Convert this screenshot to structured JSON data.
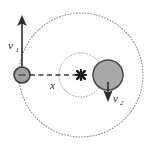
{
  "figure": {
    "name": "two-body-orbit-diagram",
    "background_color": "#ffffff",
    "stroke_color": "#2b2b2b",
    "body_fill_color": "#a8a8a8",
    "dotted_color": "#8c8c8c",
    "dashed_color": "#3a3a3a",
    "labels": {
      "v1": "v",
      "v1_sub": "1",
      "v2": "v",
      "v2_sub": "2",
      "x": "x"
    },
    "elements": {
      "outer_orbit": {
        "name": "outer-dotted-circle",
        "cx": 81,
        "cy": 75,
        "r": 62,
        "style": "dotted"
      },
      "inner_orbit": {
        "name": "inner-dotted-circle",
        "cx": 81,
        "cy": 75,
        "r": 22,
        "style": "dotted"
      },
      "small_body": {
        "name": "small-mass-circle",
        "cx": 22,
        "cy": 75,
        "r": 8
      },
      "large_body": {
        "name": "large-mass-circle",
        "cx": 108,
        "cy": 75,
        "r": 15
      },
      "center_of_mass": {
        "name": "center-of-mass-marker",
        "cx": 81,
        "cy": 75,
        "glyph": "cross-marker"
      },
      "v1_arrow": {
        "name": "velocity-vector-v1",
        "x": 22,
        "y_tail": 75,
        "y_tip": 16,
        "direction": "up"
      },
      "v2_arrow": {
        "name": "velocity-vector-v2",
        "x": 108,
        "y_tail": 84,
        "y_tip": 101,
        "direction": "down"
      },
      "separation_line": {
        "name": "separation-distance-dashed-line",
        "x1": 30,
        "x2": 78,
        "y": 75,
        "style": "dashed"
      }
    }
  }
}
